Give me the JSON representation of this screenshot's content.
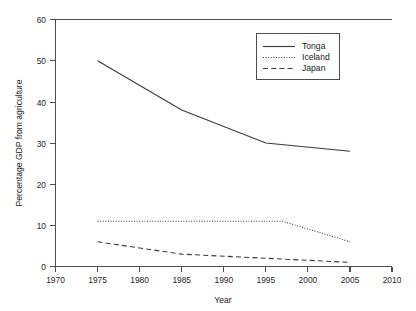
{
  "chart_data": {
    "type": "line",
    "title": "",
    "xlabel": "Year",
    "ylabel": "Percentage GDP from agriculture",
    "xlim": [
      1970,
      2010
    ],
    "ylim": [
      0,
      60
    ],
    "xticks": [
      1970,
      1975,
      1980,
      1985,
      1990,
      1995,
      2000,
      2005,
      2010
    ],
    "yticks": [
      0,
      10,
      20,
      30,
      40,
      50,
      60
    ],
    "grid": false,
    "legend_position": "top-right",
    "series": [
      {
        "name": "Tonga",
        "line_style": "solid",
        "color": "#3c3c3c",
        "x": [
          1975,
          1985,
          1995,
          2005
        ],
        "values": [
          50,
          38,
          30,
          28
        ]
      },
      {
        "name": "Iceland",
        "line_style": "dotted",
        "color": "#3c3c3c",
        "x": [
          1975,
          1995,
          1997,
          2005
        ],
        "values": [
          11,
          11,
          11,
          6
        ]
      },
      {
        "name": "Japan",
        "line_style": "dashed",
        "color": "#3c3c3c",
        "x": [
          1975,
          1985,
          1995,
          2005
        ],
        "values": [
          6,
          3,
          2,
          1
        ]
      }
    ]
  },
  "axes": {
    "x_title": "Year",
    "y_title": "Percentage GDP from agriculture",
    "x_tick_labels": [
      "1970",
      "1975",
      "1980",
      "1985",
      "1990",
      "1995",
      "2000",
      "2005",
      "2010"
    ],
    "y_tick_labels": [
      "0",
      "10",
      "20",
      "30",
      "40",
      "50",
      "60"
    ]
  },
  "legend": {
    "entries": [
      {
        "label": "Tonga",
        "style": "solid"
      },
      {
        "label": "Iceland",
        "style": "dotted"
      },
      {
        "label": "Japan",
        "style": "dashed"
      }
    ]
  },
  "colors": {
    "background": "#ffffff",
    "axis": "#4d4d4d",
    "line": "#3c3c3c",
    "text": "#1a1a1a"
  }
}
